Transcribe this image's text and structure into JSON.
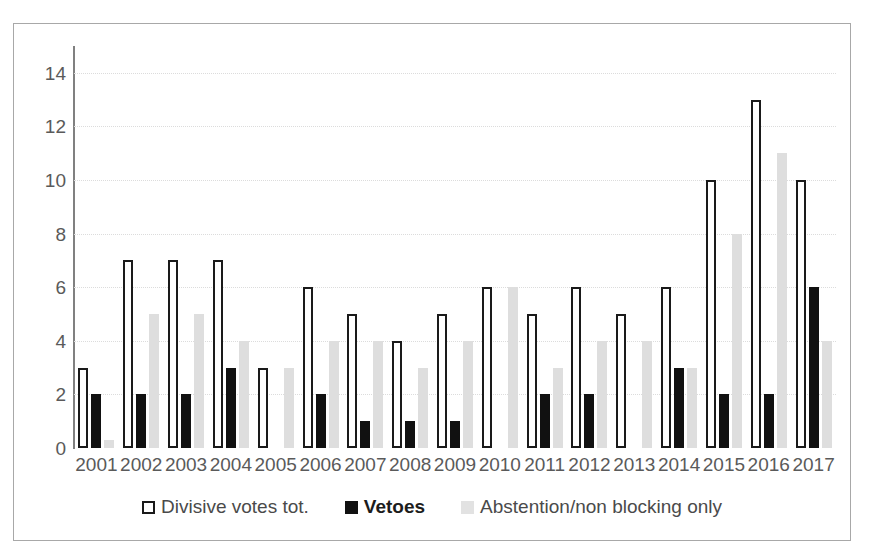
{
  "chart_data": {
    "type": "bar",
    "title": "",
    "subtitle": "",
    "xlabel": "",
    "ylabel": "",
    "ylim": [
      0,
      15
    ],
    "yticks": [
      0,
      2,
      4,
      6,
      8,
      10,
      12,
      14
    ],
    "grid": true,
    "legend_position": "bottom",
    "categories": [
      "2001",
      "2002",
      "2003",
      "2004",
      "2005",
      "2006",
      "2007",
      "2008",
      "2009",
      "2010",
      "2011",
      "2012",
      "2013",
      "2014",
      "2015",
      "2016",
      "2017"
    ],
    "series": [
      {
        "name": "Divisive votes tot.",
        "style": "outlined-white",
        "color": "#ffffff",
        "edge_color": "#1a1a1a",
        "values": [
          3,
          7,
          7,
          7,
          3,
          6,
          5,
          4,
          5,
          6,
          5,
          6,
          5,
          6,
          10,
          13,
          10
        ]
      },
      {
        "name": "Vetoes",
        "style": "filled-black",
        "color": "#111111",
        "edge_color": "#111111",
        "values": [
          2,
          2,
          2,
          3,
          0,
          2,
          1,
          1,
          1,
          0,
          2,
          2,
          0,
          3,
          2,
          2,
          6
        ]
      },
      {
        "name": "Abstention/non blocking only",
        "style": "filled-lightgray",
        "color": "#dedede",
        "edge_color": "#dedede",
        "values": [
          0.3,
          5,
          5,
          4,
          3,
          4,
          4,
          3,
          4,
          6,
          3,
          4,
          4,
          3,
          8,
          11,
          4
        ]
      }
    ]
  },
  "legend": {
    "items": [
      {
        "label": "Divisive votes tot.",
        "swatch": "outlined-white-square-icon"
      },
      {
        "label": "Vetoes",
        "swatch": "filled-black-square-icon"
      },
      {
        "label": "Abstention/non blocking only",
        "swatch": "filled-gray-square-icon"
      }
    ]
  },
  "colors": {
    "frame_border": "#a8a8a8",
    "axis": "#808080",
    "gridline": "#dcdcdc",
    "tick_text": "#5a5a5a",
    "background": "#ffffff"
  }
}
